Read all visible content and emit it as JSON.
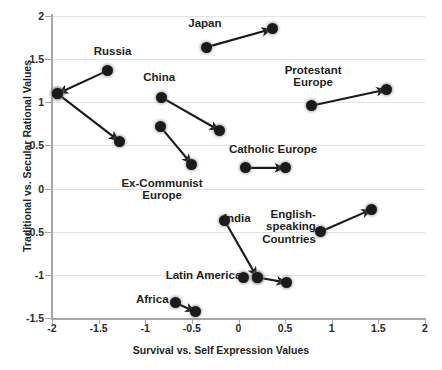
{
  "chart_data": {
    "type": "scatter",
    "title": "",
    "xlabel": "Survival vs. Self Expression Values",
    "ylabel": "Traditional vs. Secular Rational Values",
    "xlim": [
      -2,
      2
    ],
    "ylim": [
      -1.5,
      2
    ],
    "xticks": [
      "-2",
      "-1.5",
      "-1",
      "-0.5",
      "0",
      "0.5",
      "1",
      "1.5",
      "2"
    ],
    "xtick_values": [
      -2,
      -1.5,
      -1,
      -0.5,
      0,
      0.5,
      1,
      1.5,
      2
    ],
    "yticks": [
      "2",
      "1.5",
      "1",
      "0.5",
      "0",
      "-0.5",
      "-1",
      "-1.5"
    ],
    "ytick_values": [
      2,
      1.5,
      1,
      0.5,
      0,
      -0.5,
      -1,
      -1.5
    ],
    "grid": true,
    "legend": "none",
    "marker_color": "#1a1a1a",
    "arrow_color": "#1a1a1a",
    "series": [
      {
        "name": "Russia",
        "label": "Russia",
        "label_x": -1.35,
        "label_y": 1.57,
        "label_align": "center",
        "points": [
          {
            "x": -1.4,
            "y": 1.37
          },
          {
            "x": -1.94,
            "y": 1.1
          }
        ],
        "arrows": [
          {
            "from": [
              -1.4,
              1.37
            ],
            "to": [
              -1.94,
              1.1
            ]
          }
        ]
      },
      {
        "name": "Ex-Communist-branch-a",
        "label": "",
        "points": [
          {
            "x": -1.94,
            "y": 1.1
          },
          {
            "x": -1.28,
            "y": 0.55
          }
        ],
        "arrows": [
          {
            "from": [
              -1.94,
              1.1
            ],
            "to": [
              -1.28,
              0.55
            ]
          }
        ]
      },
      {
        "name": "Ex-Communist Europe",
        "label": "Ex-Communist\nEurope",
        "label_x": -0.82,
        "label_y": 0.04,
        "label_align": "center",
        "points": [
          {
            "x": -0.84,
            "y": 0.72
          },
          {
            "x": -0.5,
            "y": 0.28
          }
        ],
        "arrows": [
          {
            "from": [
              -0.84,
              0.72
            ],
            "to": [
              -0.5,
              0.28
            ]
          }
        ]
      },
      {
        "name": "China",
        "label": "China",
        "label_x": -0.85,
        "label_y": 1.27,
        "label_align": "center",
        "points": [
          {
            "x": -0.83,
            "y": 1.06
          },
          {
            "x": -0.2,
            "y": 0.67
          }
        ],
        "arrows": [
          {
            "from": [
              -0.83,
              1.06
            ],
            "to": [
              -0.2,
              0.67
            ]
          }
        ]
      },
      {
        "name": "Japan",
        "label": "Japan",
        "label_x": -0.36,
        "label_y": 1.9,
        "label_align": "center",
        "points": [
          {
            "x": -0.34,
            "y": 1.64
          },
          {
            "x": 0.36,
            "y": 1.85
          }
        ],
        "arrows": [
          {
            "from": [
              -0.34,
              1.64
            ],
            "to": [
              0.36,
              1.85
            ]
          }
        ]
      },
      {
        "name": "Protestant Europe",
        "label": "Protestant\nEurope",
        "label_x": 0.8,
        "label_y": 1.35,
        "label_align": "center",
        "points": [
          {
            "x": 0.78,
            "y": 0.96
          },
          {
            "x": 1.59,
            "y": 1.15
          }
        ],
        "arrows": [
          {
            "from": [
              0.78,
              0.96
            ],
            "to": [
              1.59,
              1.15
            ]
          }
        ]
      },
      {
        "name": "Catholic Europe",
        "label": "Catholic Europe",
        "label_x": 0.37,
        "label_y": 0.43,
        "label_align": "center",
        "points": [
          {
            "x": 0.07,
            "y": 0.24
          },
          {
            "x": 0.5,
            "y": 0.24
          }
        ],
        "arrows": [
          {
            "from": [
              0.07,
              0.24
            ],
            "to": [
              0.5,
              0.24
            ]
          }
        ]
      },
      {
        "name": "India",
        "label": "India",
        "label_x": 0.13,
        "label_y": -0.37,
        "label_align": "right",
        "points": [
          {
            "x": -0.15,
            "y": -0.37
          },
          {
            "x": 0.2,
            "y": -1.03
          }
        ],
        "arrows": [
          {
            "from": [
              -0.15,
              -0.37
            ],
            "to": [
              0.2,
              -1.03
            ]
          }
        ]
      },
      {
        "name": "Latin America",
        "label": "Latin America",
        "label_x": 0.03,
        "label_y": -1.02,
        "label_align": "right",
        "points": [
          {
            "x": 0.05,
            "y": -1.03
          },
          {
            "x": 0.2,
            "y": -1.03
          },
          {
            "x": 0.52,
            "y": -1.09
          }
        ],
        "arrows": [
          {
            "from": [
              0.2,
              -1.03
            ],
            "to": [
              0.52,
              -1.09
            ]
          }
        ]
      },
      {
        "name": "English-speaking Countries",
        "label": "English-\nspeaking\nCountries",
        "label_x": 0.83,
        "label_y": -0.32,
        "label_align": "right",
        "points": [
          {
            "x": 0.88,
            "y": -0.5
          },
          {
            "x": 1.43,
            "y": -0.24
          }
        ],
        "arrows": [
          {
            "from": [
              0.88,
              -0.5
            ],
            "to": [
              1.43,
              -0.24
            ]
          }
        ]
      },
      {
        "name": "Africa",
        "label": "Africa",
        "label_x": -0.75,
        "label_y": -1.3,
        "label_align": "right",
        "points": [
          {
            "x": -0.68,
            "y": -1.32
          },
          {
            "x": -0.46,
            "y": -1.43
          }
        ],
        "arrows": [
          {
            "from": [
              -0.68,
              -1.32
            ],
            "to": [
              -0.46,
              -1.43
            ]
          }
        ]
      }
    ]
  }
}
